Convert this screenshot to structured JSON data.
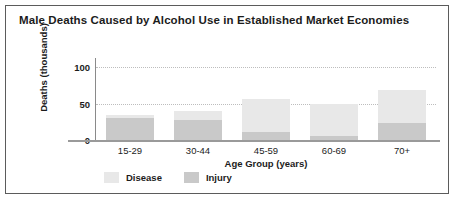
{
  "chart_data": {
    "type": "bar",
    "title": "Male Deaths Caused by Alcohol Use in Established Market Economies",
    "xlabel": "Age Group (years)",
    "ylabel": "Deaths (thousands)",
    "categories": [
      "15-29",
      "30-44",
      "45-59",
      "60-69",
      "70+"
    ],
    "yticks": [
      "0",
      "50",
      "100"
    ],
    "ylim": [
      0,
      110
    ],
    "grid": true,
    "stacked": true,
    "legend_position": "bottom-left",
    "series": [
      {
        "name": "Injury",
        "color": "#c9c9c9",
        "values": [
          30,
          28,
          11,
          5,
          24
        ]
      },
      {
        "name": "Disease",
        "color": "#e8e8e8",
        "values": [
          5,
          12,
          46,
          45,
          45
        ]
      }
    ],
    "totals": [
      35,
      40,
      57,
      50,
      69
    ],
    "annotations": []
  },
  "legend": {
    "items": [
      {
        "label": "Disease",
        "color": "#e8e8e8"
      },
      {
        "label": "Injury",
        "color": "#c9c9c9"
      }
    ]
  },
  "colors": {
    "frame": "#5b5b5b",
    "axis": "#8a8a8a",
    "grid": "#bdbdbd",
    "text": "#1c1c1c"
  }
}
